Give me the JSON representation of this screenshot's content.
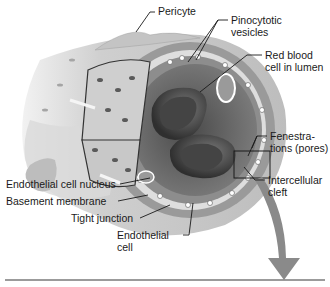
{
  "diagram": {
    "colors": {
      "background": "#ffffff",
      "wall_outer": "#c9c9c9",
      "wall_inner": "#7d7d7d",
      "lumen": "#6e6e6e",
      "rbc": "#555555",
      "label_text": "#1a1a1a",
      "leader_line": "#1a1a1a",
      "arrow": "#8a8a8a",
      "baseline": "#7a7a7a"
    },
    "labels": {
      "pericyte": "Pericyte",
      "pinocytotic_1": "Pinocytotic",
      "pinocytotic_2": "vesicles",
      "rbc_1": "Red blood",
      "rbc_2": "cell in lumen",
      "fenestrations_1": "Fenestra-",
      "fenestrations_2": "tions (pores)",
      "intercellular_1": "Intercellular",
      "intercellular_2": "cleft",
      "endo_nucleus": "Endothelial cell nucleus",
      "basement": "Basement membrane",
      "tight": "Tight junction",
      "endo_cell_1": "Endothelial",
      "endo_cell_2": "cell"
    }
  }
}
